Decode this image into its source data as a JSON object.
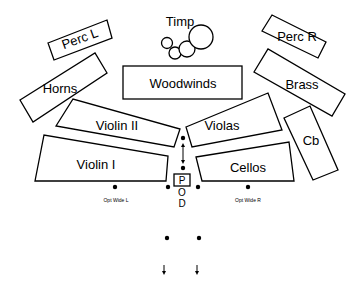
{
  "diagram": {
    "sections": [
      {
        "id": "perc-l",
        "label": "Perc L"
      },
      {
        "id": "timp",
        "label": "Timp"
      },
      {
        "id": "perc-r",
        "label": "Perc R"
      },
      {
        "id": "horns",
        "label": "Horns"
      },
      {
        "id": "woodwinds",
        "label": "Woodwinds"
      },
      {
        "id": "brass",
        "label": "Brass"
      },
      {
        "id": "violin-2",
        "label": "Violin II"
      },
      {
        "id": "violas",
        "label": "Violas"
      },
      {
        "id": "cb",
        "label": "Cb"
      },
      {
        "id": "violin-1",
        "label": "Violin I"
      },
      {
        "id": "cellos",
        "label": "Cellos"
      }
    ],
    "podium": {
      "letters": [
        "P",
        "O",
        "D"
      ]
    },
    "mic_positions": [
      {
        "id": "opt-wide-l",
        "label": "Opt Wide L"
      },
      {
        "id": "opt-wide-r",
        "label": "Opt Wide R"
      }
    ],
    "colors": {
      "stroke": "#000000",
      "fill": "#ffffff"
    }
  }
}
